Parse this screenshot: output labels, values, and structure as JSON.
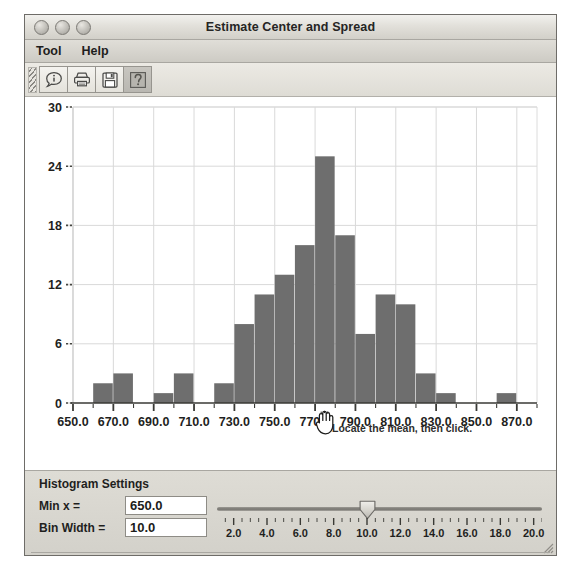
{
  "window": {
    "title": "Estimate Center and Spread",
    "controls": [
      "close-button",
      "minimize-button",
      "zoom-button"
    ]
  },
  "menubar": {
    "items": [
      {
        "label": "Tool",
        "name": "menu-tool"
      },
      {
        "label": "Help",
        "name": "menu-help"
      }
    ]
  },
  "toolbar": {
    "buttons": [
      {
        "name": "info-button",
        "icon": "speech-bubble-info-icon",
        "pressed": false
      },
      {
        "name": "print-button",
        "icon": "printer-icon",
        "pressed": false
      },
      {
        "name": "save-button",
        "icon": "floppy-disk-icon",
        "pressed": false
      },
      {
        "name": "help-button",
        "icon": "question-mark-icon",
        "pressed": true
      }
    ]
  },
  "chart_data": {
    "type": "bar",
    "title": "",
    "xlabel": "",
    "ylabel": "",
    "xlim": [
      650.0,
      880.0
    ],
    "ylim": [
      0,
      30
    ],
    "yticks": [
      0,
      6,
      12,
      18,
      24,
      30
    ],
    "xticks": [
      650.0,
      670.0,
      690.0,
      710.0,
      730.0,
      750.0,
      770.0,
      790.0,
      810.0,
      830.0,
      850.0,
      870.0
    ],
    "xtick_labels": [
      "650.0",
      "670.0",
      "690.0",
      "710.0",
      "730.0",
      "750.0",
      "770.0",
      "790.0",
      "810.0",
      "830.0",
      "850.0",
      "870.0"
    ],
    "grid": true,
    "legend": null,
    "bin_width": 10.0,
    "bin_starts": [
      660,
      670,
      690,
      700,
      720,
      730,
      740,
      750,
      760,
      770,
      780,
      790,
      800,
      810,
      820,
      830,
      860
    ],
    "values": [
      2,
      3,
      1,
      3,
      2,
      8,
      11,
      13,
      16,
      25,
      17,
      7,
      11,
      10,
      3,
      1,
      1
    ],
    "bar_color": "#6e6e6e",
    "annotation": "Locate the mean, then click."
  },
  "settings": {
    "title": "Histogram Settings",
    "min_x": {
      "label": "Min x =",
      "value": "650.0"
    },
    "bin_width": {
      "label": "Bin Width =",
      "value": "10.0"
    },
    "slider": {
      "min": 1.0,
      "max": 20.5,
      "value": 10.0,
      "labels": [
        "2.0",
        "4.0",
        "6.0",
        "8.0",
        "10.0",
        "12.0",
        "14.0",
        "16.0",
        "18.0",
        "20.0"
      ],
      "label_values": [
        2.0,
        4.0,
        6.0,
        8.0,
        10.0,
        12.0,
        14.0,
        16.0,
        18.0,
        20.0
      ]
    }
  },
  "colors": {
    "bar": "#6e6e6e",
    "window_bg": "#d5d3cd",
    "chart_bg": "#ffffff",
    "grid": "#d9d9d9"
  }
}
